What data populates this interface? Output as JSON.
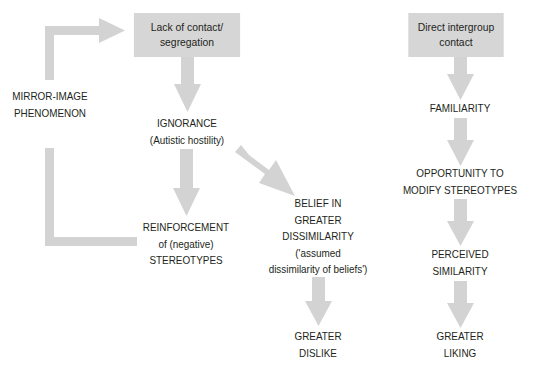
{
  "colors": {
    "box_fill": "#d6d6d6",
    "arrow_fill": "#d3d3d3",
    "text": "#231f20",
    "background": "#ffffff"
  },
  "left_flow": {
    "start_box": {
      "lines": [
        "Lack of contact/",
        "segregation"
      ]
    },
    "ignorance": {
      "lines": [
        "IGNORANCE",
        "(Autistic hostility)"
      ]
    },
    "reinforcement": {
      "lines": [
        "REINFORCEMENT",
        "of (negative)",
        "STEREOTYPES"
      ]
    },
    "belief": {
      "lines": [
        "BELIEF IN",
        "GREATER",
        "DISSIMILARITY",
        "('assumed",
        "dissimilarity of beliefs')"
      ]
    },
    "dislike": {
      "lines": [
        "GREATER",
        "DISLIKE"
      ]
    },
    "loop_label": {
      "lines": [
        "MIRROR-IMAGE",
        "PHENOMENON"
      ]
    }
  },
  "right_flow": {
    "start_box": {
      "lines": [
        "Direct intergroup",
        "contact"
      ]
    },
    "familiarity": {
      "lines": [
        "FAMILIARITY"
      ]
    },
    "opportunity": {
      "lines": [
        "OPPORTUNITY TO",
        "MODIFY STEREOTYPES"
      ]
    },
    "similarity": {
      "lines": [
        "PERCEIVED",
        "SIMILARITY"
      ]
    },
    "liking": {
      "lines": [
        "GREATER",
        "LIKING"
      ]
    }
  }
}
